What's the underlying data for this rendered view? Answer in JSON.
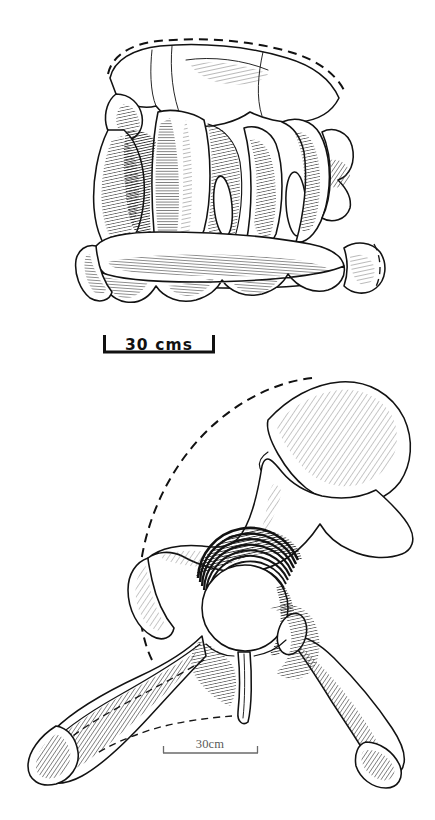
{
  "plate": {
    "background_color": "#ffffff",
    "ink_color": "#121212",
    "medium": "pen-and-ink line drawing with hatched shading",
    "width": 435,
    "height": 820
  },
  "figures": [
    {
      "id": "upper",
      "subject": "vertebra",
      "view": "anterior oblique",
      "position": "top half of plate",
      "features": [
        "neural spine",
        "transverse processes",
        "paired lateral openings",
        "centrum with scalloped ventral margin",
        "dashed reconstruction of missing dorsal outline"
      ],
      "scalebar": {
        "label": "30 cms",
        "style": "bold sans-serif with serif end caps",
        "color": "#111111",
        "length_px": 112
      }
    },
    {
      "id": "lower",
      "subject": "pelvis",
      "view": "lateral",
      "position": "bottom half of plate",
      "features": [
        "iliac blade",
        "acetabulum",
        "pubis",
        "ischium",
        "obturator foramen",
        "dashed reconstruction of missing iliac margin"
      ],
      "scalebar": {
        "label": "30cm",
        "style": "light serif with thin rule",
        "color": "#5a5a5a",
        "length_px": 95
      }
    }
  ],
  "shading": {
    "dark_hatch": "#141414",
    "mid_hatch": "#2a2a2a",
    "light_hatch": "#4a4a4a",
    "outline": "#121212"
  }
}
